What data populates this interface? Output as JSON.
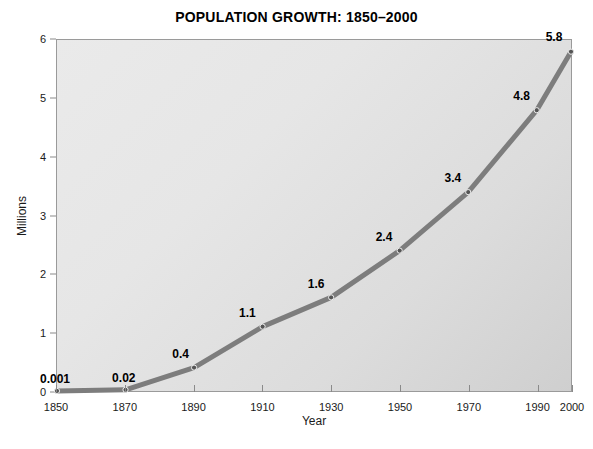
{
  "chart_data": {
    "type": "line",
    "title": "POPULATION GROWTH: 1850–2000",
    "xlabel": "Year",
    "ylabel": "Millions",
    "x": [
      1850,
      1870,
      1890,
      1910,
      1930,
      1950,
      1970,
      1990,
      2000
    ],
    "values": [
      0.001,
      0.02,
      0.4,
      1.1,
      1.6,
      2.4,
      3.4,
      4.8,
      5.8
    ],
    "point_labels": [
      "0.001",
      "0.02",
      "0.4",
      "1.1",
      "1.6",
      "2.4",
      "3.4",
      "4.8",
      "5.8"
    ],
    "xlim": [
      1850,
      2000
    ],
    "ylim": [
      0,
      6
    ],
    "xticks": [
      1850,
      1870,
      1890,
      1910,
      1930,
      1950,
      1970,
      1990,
      2000
    ],
    "xtick_labels": [
      "1850",
      "1870",
      "1890",
      "1910",
      "1930",
      "1950",
      "1970",
      "1990",
      "2000"
    ],
    "yticks": [
      0,
      1,
      2,
      3,
      4,
      5,
      6
    ],
    "ytick_labels": [
      "0",
      "1",
      "2",
      "3",
      "4",
      "5",
      "6"
    ],
    "grid": false,
    "legend": false,
    "series_name": "Population",
    "line_color": "#7d7d7d",
    "marker_color": "#555555",
    "plot_bg_light": "#eaeaea",
    "plot_bg_dark": "#cfcfcf",
    "frame_color": "#9a9a9a",
    "text_color": "#111111",
    "page_bg": "#ffffff"
  }
}
